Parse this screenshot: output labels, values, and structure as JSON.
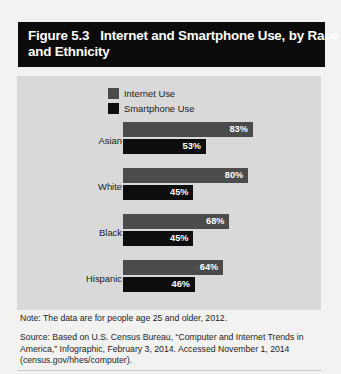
{
  "figure": {
    "number": "Figure 5.3",
    "title_line1": "Internet and Smartphone Use, by Race",
    "title_line2": "and Ethnicity"
  },
  "legend": {
    "items": [
      {
        "label": "Internet Use",
        "color": "#4b4b4b",
        "swatch_name": "legend-swatch-internet"
      },
      {
        "label": "Smartphone Use",
        "color": "#0d0d0d",
        "swatch_name": "legend-swatch-smartphone"
      }
    ]
  },
  "notes": {
    "note": "Note: The data are for people age 25 and older, 2012.",
    "source": "Source: Based on U.S. Census Bureau, “Computer and Internet Trends in America,” Infographic, February 3, 2014. Accessed November 1, 2014 (census.gov/hhes/computer)."
  },
  "chart_data": {
    "type": "bar",
    "orientation": "horizontal",
    "title": "Internet and Smartphone Use, by Race and Ethnicity",
    "xlabel": "",
    "ylabel": "",
    "xlim": [
      0,
      100
    ],
    "grid": false,
    "legend_position": "top-center",
    "categories": [
      "Asian",
      "White",
      "Black",
      "Hispanic"
    ],
    "series": [
      {
        "name": "Internet Use",
        "color": "#4b4b4b",
        "values": [
          83,
          80,
          68,
          64
        ],
        "labels": [
          "83%",
          "80%",
          "68%",
          "64%"
        ]
      },
      {
        "name": "Smartphone Use",
        "color": "#0d0d0d",
        "values": [
          53,
          45,
          45,
          46
        ],
        "labels": [
          "53%",
          "45%",
          "45%",
          "46%"
        ]
      }
    ]
  }
}
